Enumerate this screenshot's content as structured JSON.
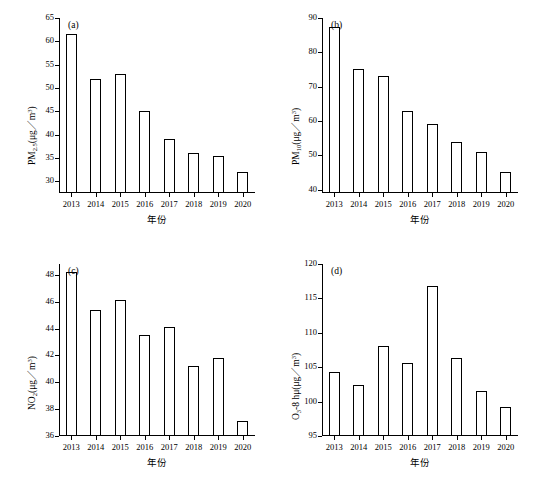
{
  "figure": {
    "panels": [
      {
        "tag": "(a)",
        "ylabel_html": "PM<sub>2.5</sub>(μg／m<sup>3</sup>)",
        "xlabel": "年份",
        "chart_data": {
          "type": "bar",
          "title": "(a)",
          "xlabel": "年份",
          "ylabel": "PM2.5(μg/m3)",
          "categories": [
            "2013",
            "2014",
            "2015",
            "2016",
            "2017",
            "2018",
            "2019",
            "2020"
          ],
          "values": [
            61.5,
            52.0,
            53.0,
            45.0,
            39.0,
            36.0,
            35.5,
            32.0
          ],
          "ylim": [
            27.5,
            65
          ],
          "yticks": [
            30,
            35,
            40,
            45,
            50,
            55,
            60,
            65
          ],
          "grid": false,
          "legend": "none"
        }
      },
      {
        "tag": "(b)",
        "ylabel_html": "PM<sub>10</sub>(μg／m<sup>3</sup>)",
        "xlabel": "年份",
        "chart_data": {
          "type": "bar",
          "title": "(b)",
          "xlabel": "年份",
          "ylabel": "PM10(μg/m3)",
          "categories": [
            "2013",
            "2014",
            "2015",
            "2016",
            "2017",
            "2018",
            "2019",
            "2020"
          ],
          "values": [
            87.5,
            75.0,
            73.0,
            63.0,
            59.0,
            54.0,
            51.0,
            45.0
          ],
          "ylim": [
            39,
            90
          ],
          "yticks": [
            40,
            50,
            60,
            70,
            80,
            90
          ],
          "grid": false,
          "legend": "none"
        }
      },
      {
        "tag": "(c)",
        "ylabel_html": "NO<sub>2</sub>(μg／m<sup>3</sup>)",
        "xlabel": "年份",
        "chart_data": {
          "type": "bar",
          "title": "(c)",
          "xlabel": "年份",
          "ylabel": "NO2(μg/m3)",
          "categories": [
            "2013",
            "2014",
            "2015",
            "2016",
            "2017",
            "2018",
            "2019",
            "2020"
          ],
          "values": [
            48.2,
            45.4,
            46.1,
            43.5,
            44.1,
            41.2,
            41.8,
            37.1
          ],
          "ylim": [
            36,
            48.8
          ],
          "yticks": [
            36,
            38,
            40,
            42,
            44,
            46,
            48
          ],
          "grid": false,
          "legend": "none"
        }
      },
      {
        "tag": "(d)",
        "ylabel_html": "O<sub>3</sub>-8 hμ(μg／m<sup>3</sup>)",
        "xlabel": "年份",
        "chart_data": {
          "type": "bar",
          "title": "(d)",
          "xlabel": "年份",
          "ylabel": "O3-8h(μg/m3)",
          "categories": [
            "2013",
            "2014",
            "2015",
            "2016",
            "2017",
            "2018",
            "2019",
            "2020"
          ],
          "values": [
            104.3,
            102.4,
            108.1,
            105.6,
            116.8,
            106.4,
            101.5,
            99.2
          ],
          "ylim": [
            95,
            120
          ],
          "yticks": [
            95,
            100,
            105,
            110,
            115,
            120
          ],
          "grid": false,
          "legend": "none"
        }
      }
    ]
  }
}
